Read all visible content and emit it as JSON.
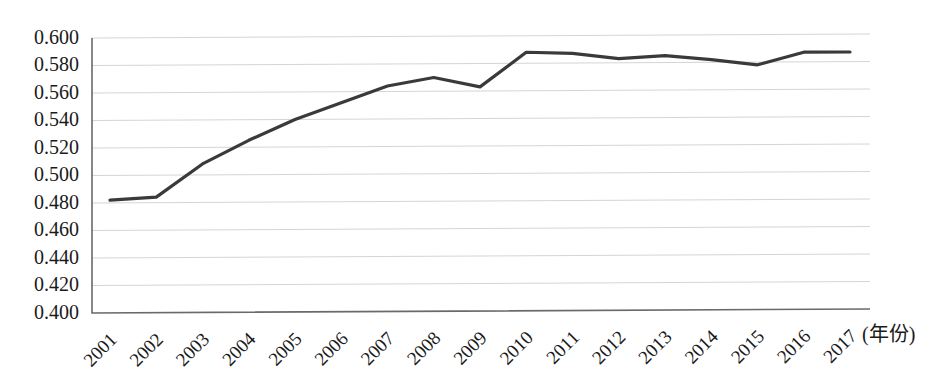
{
  "chart_data": {
    "type": "line",
    "title": "",
    "subtitle": "",
    "xlabel": "(年份)",
    "ylabel": "",
    "grid": true,
    "legend": false,
    "legend_position": "none",
    "line_color": "#3a3a3a",
    "x": [
      2001,
      2002,
      2003,
      2004,
      2005,
      2006,
      2007,
      2008,
      2009,
      2010,
      2011,
      2012,
      2013,
      2014,
      2015,
      2016,
      2017
    ],
    "categories": [
      "2001",
      "2002",
      "2003",
      "2004",
      "2005",
      "2006",
      "2007",
      "2008",
      "2009",
      "2010",
      "2011",
      "2012",
      "2013",
      "2014",
      "2015",
      "2016",
      "2017"
    ],
    "values": [
      0.482,
      0.484,
      0.508,
      0.525,
      0.54,
      0.552,
      0.564,
      0.57,
      0.563,
      0.588,
      0.587,
      0.583,
      0.585,
      0.582,
      0.578,
      0.587,
      0.587
    ],
    "series": [
      {
        "name": "",
        "values": [
          0.482,
          0.484,
          0.508,
          0.525,
          0.54,
          0.552,
          0.564,
          0.57,
          0.563,
          0.588,
          0.587,
          0.583,
          0.585,
          0.582,
          0.578,
          0.587,
          0.587
        ]
      }
    ],
    "ylim": [
      0.4,
      0.6
    ],
    "ytick_step": 0.02,
    "ytick_labels": [
      "0.600",
      "0.580",
      "0.560",
      "0.540",
      "0.520",
      "0.500",
      "0.480",
      "0.460",
      "0.440",
      "0.420",
      "0.400"
    ],
    "ytick_values": [
      0.6,
      0.58,
      0.56,
      0.54,
      0.52,
      0.5,
      0.48,
      0.46,
      0.44,
      0.42,
      0.4
    ],
    "xtick_rotation_deg": -45
  }
}
